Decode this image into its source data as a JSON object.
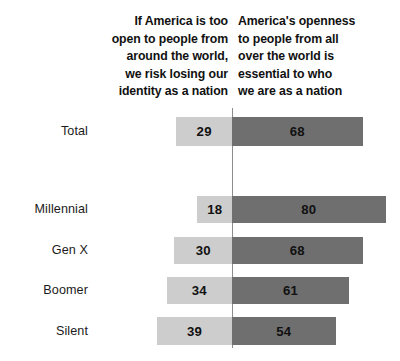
{
  "header": {
    "left_label": "If America is too\nopen to people from\naround the world,\nwe risk losing our\nidentity as a nation",
    "right_label": "America's openness\nto people from all\nover the world is\nessential to who\nwe are as a nation"
  },
  "colors": {
    "left_bar": "#cdcdcd",
    "right_bar": "#6f6f6f",
    "divider": "#8c8c8c",
    "text": "#111111",
    "background": "#ffffff"
  },
  "rows": [
    {
      "label": "Total",
      "left_value": "29",
      "right_value": "68",
      "label_top": 124,
      "bar_top": 117,
      "bar_height": 29
    },
    {
      "label": "Millennial",
      "left_value": "18",
      "right_value": "80",
      "label_top": 202,
      "bar_top": 196,
      "bar_height": 27
    },
    {
      "label": "Gen X",
      "left_value": "30",
      "right_value": "68",
      "label_top": 243,
      "bar_top": 237,
      "bar_height": 27
    },
    {
      "label": "Boomer",
      "left_value": "34",
      "right_value": "61",
      "label_top": 283,
      "bar_top": 277,
      "bar_height": 27
    },
    {
      "label": "Silent",
      "left_value": "39",
      "right_value": "54",
      "label_top": 324,
      "bar_top": 317,
      "bar_height": 28
    }
  ],
  "chart_data": {
    "type": "bar",
    "orientation": "horizontal-diverging",
    "title": "",
    "subtitle": "",
    "xlabel": "",
    "ylabel": "",
    "categories": [
      "Total",
      "Millennial",
      "Gen X",
      "Boomer",
      "Silent"
    ],
    "series": [
      {
        "name": "If America is too open to people from around the world, we risk losing our identity as a nation",
        "values": [
          29,
          18,
          30,
          34,
          39
        ],
        "color": "#cdcdcd",
        "side": "left"
      },
      {
        "name": "America's openness to people from all over the world is essential to who we are as a nation",
        "values": [
          68,
          80,
          68,
          61,
          54
        ],
        "color": "#6f6f6f",
        "side": "right"
      }
    ],
    "units": "percent",
    "xlim": [
      -45,
      90
    ],
    "grid": false,
    "legend_position": "top",
    "center_axis_value": 0,
    "pixels_per_unit": 1.92,
    "center_x_px": 232
  }
}
